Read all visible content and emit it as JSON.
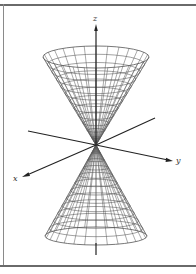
{
  "figure": {
    "type": "double-cone-surface",
    "axes": {
      "x_label": "x",
      "y_label": "y",
      "z_label": "z"
    },
    "colors": {
      "mesh": "#555555",
      "axis": "#222222",
      "frame": "#6a6a6a"
    },
    "geometry": {
      "apex": [
        96,
        145
      ],
      "top_rim": {
        "cx": 96,
        "cy": 57,
        "rx": 53,
        "ry": 11
      },
      "bottom_rim": {
        "cx": 96,
        "cy": 236,
        "rx": 51,
        "ry": 9
      },
      "rings": 12,
      "rulings": 28
    }
  }
}
